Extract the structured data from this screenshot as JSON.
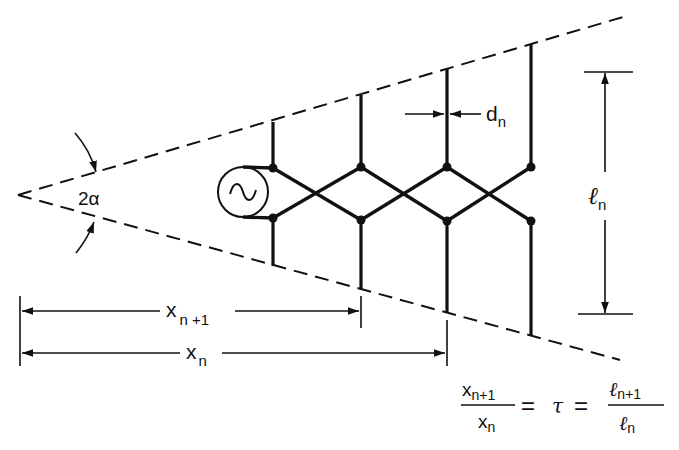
{
  "figure": {
    "colors": {
      "ink": "#111111",
      "background": "#ffffff"
    }
  },
  "labels": {
    "angle": "2α",
    "spacing_dn": "d",
    "spacing_dn_sub": "n",
    "length_ln": "ℓ",
    "length_ln_sub": "n",
    "xn1": "x",
    "xn1_sub": "n +1",
    "xn": "x",
    "xn_sub": "n"
  },
  "equation": {
    "num1": "x",
    "num1_sub": "n+1",
    "den1": "x",
    "den1_sub": "n",
    "eq1": "=",
    "tau": "τ",
    "eq2": "=",
    "num2": "ℓ",
    "num2_sub": "n+1",
    "den2": "ℓ",
    "den2_sub": "n"
  },
  "icons": {
    "source": "ac-generator-icon",
    "source_glyph": "~"
  },
  "elements": [
    {
      "x": 273,
      "top": 122,
      "upper_junction": 168,
      "lower_junction": 218,
      "bottom": 266
    },
    {
      "x": 361,
      "top": 95,
      "upper_junction": 167,
      "lower_junction": 220,
      "bottom": 290
    },
    {
      "x": 447,
      "top": 69,
      "upper_junction": 167,
      "lower_junction": 221,
      "bottom": 313
    },
    {
      "x": 531,
      "top": 44,
      "upper_junction": 167,
      "lower_junction": 221,
      "bottom": 336
    }
  ]
}
